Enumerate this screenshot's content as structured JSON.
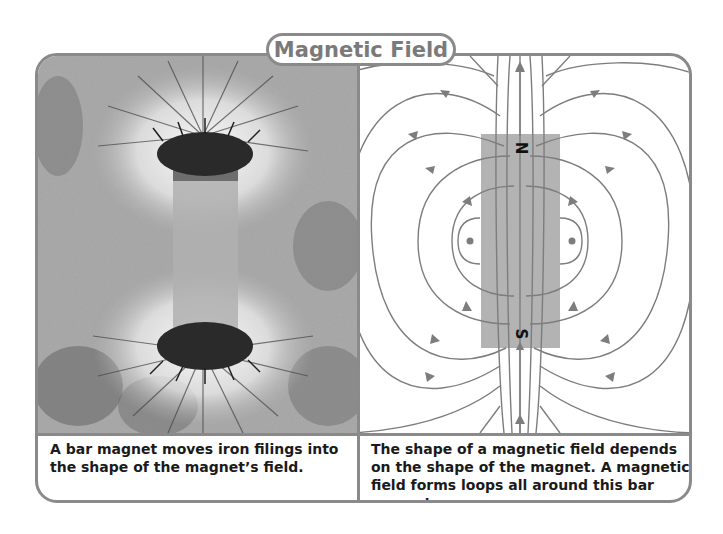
{
  "title": "Magnetic Field",
  "left_panel": {
    "image_description": "Photo of iron filings arranged around a bar magnet",
    "caption": "A bar magnet moves iron filings into the shape of the magnet’s field."
  },
  "right_panel": {
    "image_description": "Diagram of magnetic field lines looping around a bar magnet",
    "magnet_labels": {
      "north": "N",
      "south": "S"
    },
    "caption": "The shape of a magnetic field depends on the shape of the magnet. A magnetic field forms loops all around this bar magnet."
  },
  "colors": {
    "frame": "#8a8a8a",
    "title_text": "#7a7a7a",
    "magnet_fill": "#b3b3b3",
    "field_line": "#7d7d7d",
    "caption_text": "#1a1a1a"
  }
}
